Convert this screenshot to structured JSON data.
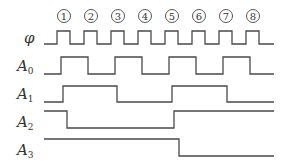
{
  "diagram": {
    "type": "timing-diagram",
    "clock_label": "φ",
    "pulse_numbers": [
      "1",
      "2",
      "3",
      "4",
      "5",
      "6",
      "7",
      "8"
    ],
    "signals": [
      {
        "name": "A",
        "subscript": "0"
      },
      {
        "name": "A",
        "subscript": "1"
      },
      {
        "name": "A",
        "subscript": "2"
      },
      {
        "name": "A",
        "subscript": "3"
      }
    ]
  }
}
